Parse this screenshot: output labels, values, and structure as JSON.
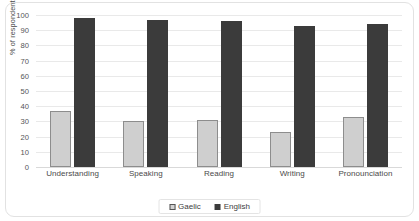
{
  "chart_data": {
    "type": "bar",
    "title": "",
    "xlabel": "",
    "ylabel": "% of respondents",
    "ylim": [
      0,
      100
    ],
    "ytick_step": 10,
    "yticks": [
      100,
      90,
      80,
      70,
      60,
      50,
      40,
      30,
      20,
      10,
      0
    ],
    "grid": true,
    "legend_position": "bottom-center",
    "categories": [
      "Understanding",
      "Speaking",
      "Reading",
      "Writing",
      "Pronounciation"
    ],
    "series": [
      {
        "name": "Gaelic",
        "color": "#cfcfcf",
        "border_color": "#8d8d8d",
        "values": [
          37,
          30,
          31,
          23,
          33
        ]
      },
      {
        "name": "English",
        "color": "#3b3b3b",
        "border_color": "#3b3b3b",
        "values": [
          98,
          97,
          96,
          93,
          94
        ]
      }
    ]
  },
  "legend": {
    "items": [
      {
        "label": "Gaelic",
        "swatch": "gaelic-swatch-icon"
      },
      {
        "label": "English",
        "swatch": "english-swatch-icon"
      }
    ]
  },
  "colors": {
    "frame_border": "#e2e2e2",
    "gridline": "#e9e9e9",
    "axis_line": "#d9d9d9",
    "text": "#3a3a3a",
    "background": "#ffffff"
  }
}
